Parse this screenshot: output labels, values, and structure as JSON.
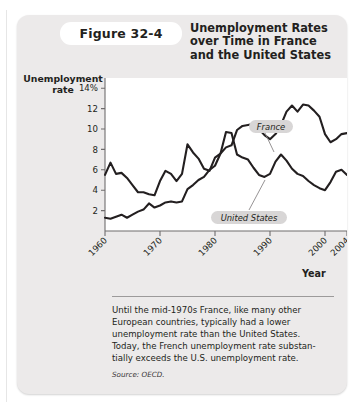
{
  "figure": {
    "tab_label": "Figure 32-4",
    "title_line1": "Unemployment Rates",
    "title_line2": "over Time in France",
    "title_line3": "and the United States",
    "y_axis_title_line1": "Unemployment",
    "y_axis_title_line2": "rate",
    "x_axis_title": "Year"
  },
  "caption": {
    "line1": "Until the mid-1970s France, like many other",
    "line2": "European countries, typically had a lower",
    "line3": "unemployment rate than the United States.",
    "line4": "Today, the French unemployment rate substan-",
    "line5": "tially exceeds the U.S. unemployment rate.",
    "source": "Source: OECD."
  },
  "chart_data": {
    "type": "line",
    "title": "Unemployment Rates over Time in France and the United States",
    "xlabel": "Year",
    "ylabel": "Unemployment rate",
    "xlim": [
      1960,
      2004
    ],
    "ylim": [
      0,
      15
    ],
    "xticks": [
      1960,
      1970,
      1980,
      1990,
      2000,
      2004
    ],
    "xticklabels": [
      "1960",
      "1970",
      "1980",
      "1990",
      "2000",
      "2004"
    ],
    "yticks": [
      2,
      4,
      6,
      8,
      10,
      12,
      14
    ],
    "yticklabels": [
      "2",
      "4",
      "6",
      "8",
      "10",
      "12",
      "14%"
    ],
    "grid": false,
    "legend": "inline-labels",
    "line_color": "#231f20",
    "plot_background": "#ffffff",
    "x": [
      1960,
      1961,
      1962,
      1963,
      1964,
      1965,
      1966,
      1967,
      1968,
      1969,
      1970,
      1971,
      1972,
      1973,
      1974,
      1975,
      1976,
      1977,
      1978,
      1979,
      1980,
      1981,
      1982,
      1983,
      1984,
      1985,
      1986,
      1987,
      1988,
      1989,
      1990,
      1991,
      1992,
      1993,
      1994,
      1995,
      1996,
      1997,
      1998,
      1999,
      2000,
      2001,
      2002,
      2003,
      2004
    ],
    "series": [
      {
        "name": "United States",
        "label": "United States",
        "label_x": 1987,
        "label_y": 5.0,
        "values": [
          5.5,
          6.7,
          5.6,
          5.7,
          5.2,
          4.5,
          3.8,
          3.8,
          3.6,
          3.5,
          4.9,
          5.9,
          5.6,
          4.9,
          5.6,
          8.5,
          7.7,
          7.1,
          6.1,
          5.9,
          7.2,
          7.6,
          9.7,
          9.6,
          7.5,
          7.2,
          7.0,
          6.2,
          5.5,
          5.3,
          5.6,
          6.8,
          7.5,
          6.9,
          6.1,
          5.6,
          5.4,
          4.9,
          4.5,
          4.2,
          4.0,
          4.8,
          5.8,
          6.0,
          5.5
        ]
      },
      {
        "name": "France",
        "label": "France",
        "label_x": 1992,
        "label_y": 13.2,
        "values": [
          1.3,
          1.2,
          1.4,
          1.6,
          1.3,
          1.6,
          1.9,
          2.1,
          2.7,
          2.3,
          2.5,
          2.8,
          2.9,
          2.8,
          2.9,
          4.1,
          4.5,
          5.0,
          5.3,
          6.0,
          6.4,
          7.6,
          8.2,
          8.4,
          9.9,
          10.3,
          10.4,
          10.5,
          10.0,
          9.4,
          9.0,
          9.5,
          10.4,
          11.7,
          12.3,
          11.7,
          12.4,
          12.3,
          11.8,
          11.2,
          9.5,
          8.7,
          9.0,
          9.5,
          9.6
        ]
      }
    ]
  }
}
